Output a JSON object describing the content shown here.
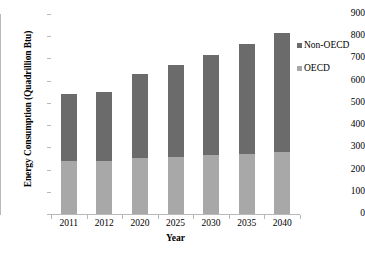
{
  "chart_data": {
    "type": "bar",
    "subtype": "stacked-vertical",
    "title": "",
    "xlabel": "Year",
    "ylabel": "Energy Consumption (Quadrillion Btu)",
    "categories": [
      "2011",
      "2012",
      "2020",
      "2025",
      "2030",
      "2035",
      "2040"
    ],
    "series": [
      {
        "name": "OECD",
        "color": "#a8a8a8",
        "values": [
          240,
          237,
          251,
          257,
          265,
          271,
          279
        ]
      },
      {
        "name": "Non-OECD",
        "color": "#6b6b6b",
        "values": [
          298,
          311,
          377,
          415,
          450,
          492,
          535
        ]
      }
    ],
    "totals": [
      538,
      548,
      628,
      672,
      715,
      763,
      814
    ],
    "stack_order": [
      "OECD",
      "Non-OECD"
    ],
    "ylim": [
      0,
      900
    ],
    "ytick_step": 100,
    "yticks": [
      "900",
      "800",
      "700",
      "600",
      "500",
      "400",
      "300",
      "200",
      "100",
      "0"
    ],
    "grid": false,
    "legend": {
      "position": "right",
      "entries": [
        {
          "label": "Non-OECD",
          "color": "#6b6b6b"
        },
        {
          "label": "OECD",
          "color": "#a8a8a8"
        }
      ]
    },
    "axis_color": "#b9b9b9"
  }
}
